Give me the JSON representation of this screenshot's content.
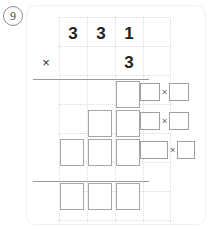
{
  "problem": {
    "number": "9",
    "badge_name": "problem-number-9"
  },
  "worksheet": {
    "type": "long-multiplication-grid",
    "multiplicand": "331",
    "multiplier": "3",
    "operator": "×",
    "multiplicand_digits": [
      "3",
      "3",
      "1"
    ],
    "multiplier_digits": [
      "",
      "",
      "3"
    ]
  },
  "grid": {
    "columns": 4,
    "rows": 7,
    "dotted": true
  },
  "answer_rows": [
    {
      "label": "partial-product-row-1",
      "boxes": 1
    },
    {
      "label": "partial-product-row-2",
      "boxes": 2
    },
    {
      "label": "partial-product-row-3",
      "boxes": 3
    },
    {
      "label": "total-row",
      "boxes": 3
    }
  ],
  "side_prompts": [
    {
      "name": "side-equation-1",
      "left_value": "",
      "operator": "×",
      "right_value": "",
      "left_wide": false
    },
    {
      "name": "side-equation-2",
      "left_value": "",
      "operator": "×",
      "right_value": "",
      "left_wide": false
    },
    {
      "name": "side-equation-3",
      "left_value": "",
      "operator": "×",
      "right_value": "",
      "left_wide": true
    }
  ],
  "colors": {
    "digit": "#222222",
    "box_border": "#a6a6a6",
    "grid_dots": "#dcdcdc",
    "rule": "#9a9a9a",
    "card_border": "#f0f0f0",
    "badge_border": "#8a8a8a"
  }
}
